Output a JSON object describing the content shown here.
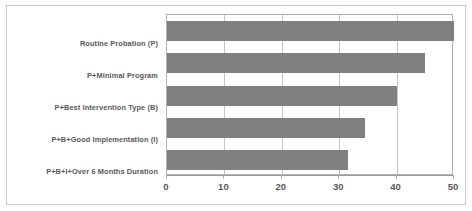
{
  "chart_data": {
    "type": "bar",
    "orientation": "horizontal",
    "title": "",
    "subtitle": "",
    "xlabel": "",
    "ylabel": "",
    "categories": [
      "Routine Probation (P)",
      "P+Minimal Program",
      "P+Best Intervention Type (B)",
      "P+B+Good Implementation (I)",
      "P+B+I+Over 6 Months Duration"
    ],
    "values": [
      50,
      45,
      40,
      34.5,
      31.5
    ],
    "xlim": [
      0,
      50
    ],
    "xticks": [
      0,
      10,
      20,
      30,
      40,
      50
    ],
    "xtick_labels": [
      "0",
      "10",
      "20",
      "30",
      "40",
      "50"
    ],
    "grid": true,
    "grid_axis": "x",
    "legend": false,
    "legend_position": "none",
    "bar_color": "#808080",
    "frame_color": "#c9c9c9",
    "plot_border_color": "#b0b0b0",
    "gridline_color": "#c4c4c4",
    "text_color": "#58595b",
    "background_color": "#ffffff"
  }
}
